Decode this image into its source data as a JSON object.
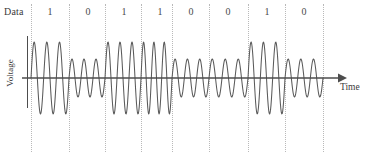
{
  "diagram": {
    "title_label": "Data",
    "y_axis_label": "Voltage",
    "x_axis_label": "Time",
    "footer_clipped": "",
    "colors": {
      "wave": "#5a5a5a",
      "axis": "#4d4d4d",
      "boundary": "#b9b9b9",
      "text": "#3b3b3b",
      "background": "#ffffff"
    },
    "bits": [
      {
        "value": "1",
        "x": 31
      },
      {
        "value": "0",
        "x": 69
      },
      {
        "value": "1",
        "x": 105
      },
      {
        "value": "1",
        "x": 141
      },
      {
        "value": "0",
        "x": 172
      },
      {
        "value": "0",
        "x": 209
      },
      {
        "value": "1",
        "x": 248
      },
      {
        "value": "0",
        "x": 285
      }
    ],
    "boundaries": [
      31,
      69,
      105,
      141,
      172,
      209,
      248,
      285,
      323
    ],
    "signal": {
      "baseline_y": 78,
      "amplitude_high": 36,
      "amplitude_low": 19,
      "cycles_per_bit": 3,
      "modulation": "amplitude-shift-keying"
    }
  }
}
